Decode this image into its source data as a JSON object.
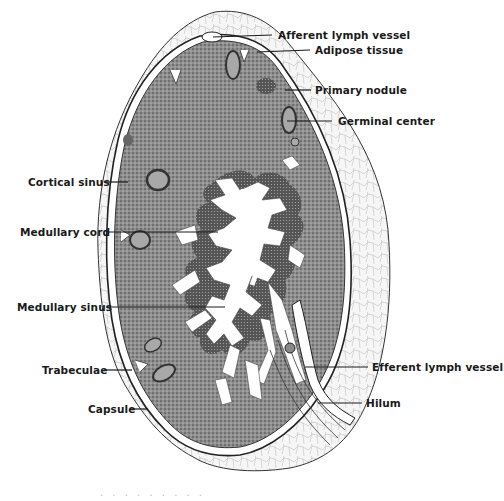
{
  "figure": {
    "colors": {
      "background": "#ffffff",
      "ink": "#1a1a1a",
      "cortex": "#8a8a8a",
      "cortex_dark": "#5a5a5a",
      "adipose": "#f2f2f2",
      "sinus": "#ffffff"
    }
  },
  "labels": {
    "afferent_lymph_vessel": "Afferent lymph vessel",
    "adipose_tissue": "Adipose tissue",
    "primary_nodule": "Primary nodule",
    "germinal_center": "Germinal center",
    "cortical_sinus": "Cortical sinus",
    "medullary_cord": "Medullary cord",
    "medullary_sinus": "Medullary sinus",
    "trabeculae": "Trabeculae",
    "capsule": "Capsule",
    "efferent_lymph_vessel": "Efferent lymph vessel",
    "hilum": "Hilum"
  },
  "caption": {
    "text": ". . . . . . . . ."
  }
}
